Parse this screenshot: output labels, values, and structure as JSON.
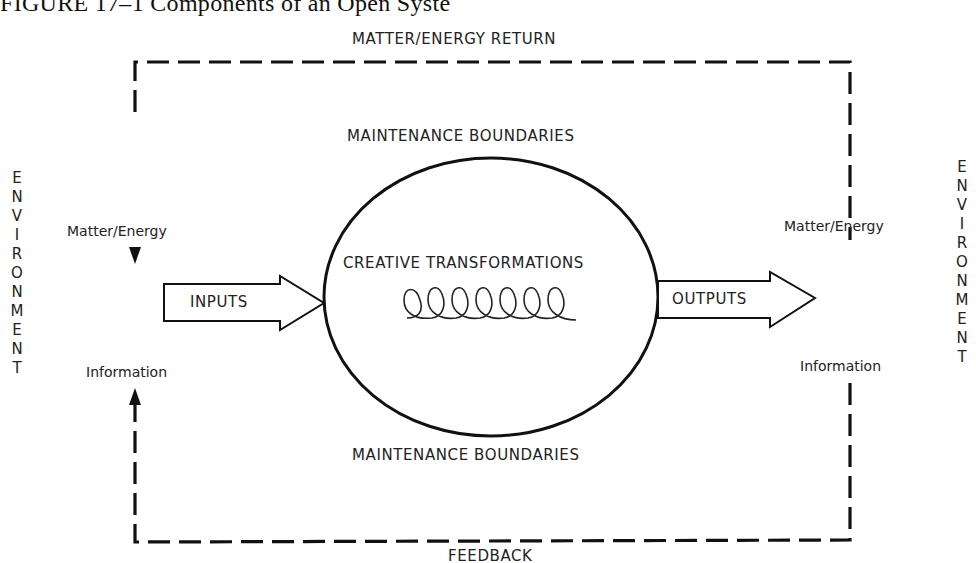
{
  "caption": {
    "visible_text": "FIGURE 17–1   Components of an Open Syste",
    "note": "caption partially clipped at top edge of image"
  },
  "labels": {
    "matter_energy_return": "MATTER/ENERGY RETURN",
    "maintenance_boundaries_top": "MAINTENANCE BOUNDARIES",
    "maintenance_boundaries_bottom": "MAINTENANCE BOUNDARIES",
    "creative_transformations": "CREATIVE TRANSFORMATIONS",
    "inputs": "INPUTS",
    "outputs": "OUTPUTS",
    "left_matter_energy": "Matter/Energy",
    "right_matter_energy": "Matter/Energy",
    "left_information": "Information",
    "right_information": "Information",
    "feedback": "FEEDBACK"
  },
  "environment": {
    "left_letters": [
      "E",
      "N",
      "V",
      "I",
      "R",
      "O",
      "N",
      "M",
      "E",
      "N",
      "T"
    ],
    "right_letters": [
      "E",
      "N",
      "V",
      "I",
      "R",
      "O",
      "N",
      "M",
      "E",
      "N",
      "T"
    ]
  },
  "colors": {
    "ink": "#1a1a1a",
    "background": "#ffffff"
  }
}
